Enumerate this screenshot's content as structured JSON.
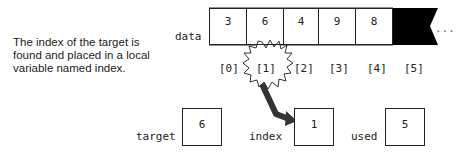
{
  "caption": "The index of the target is found and placed in a local variable named index.",
  "array": {
    "label": "data",
    "cells": [
      "3",
      "6",
      "4",
      "9",
      "8"
    ],
    "indices": [
      "[0]",
      "[1]",
      "[2]",
      "[3]",
      "[4]",
      "[5]"
    ],
    "continuation": "..."
  },
  "variables": [
    {
      "label": "target",
      "value": "6"
    },
    {
      "label": "index",
      "value": "1"
    },
    {
      "label": "used",
      "value": "5"
    }
  ],
  "colors": {
    "stroke": "#222222",
    "arrow": "#333333",
    "filled_cell": "#000000"
  }
}
